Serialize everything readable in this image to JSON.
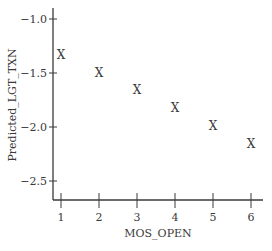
{
  "chart_data": {
    "type": "scatter",
    "title": "",
    "xlabel": "MOS_OPEN",
    "ylabel": "Predicted_LGT_TXN",
    "marker": "X",
    "x": [
      1,
      2,
      3,
      4,
      5,
      6
    ],
    "y": [
      -1.33,
      -1.5,
      -1.66,
      -1.82,
      -1.99,
      -2.16
    ],
    "xticks": [
      1,
      2,
      3,
      4,
      5,
      6
    ],
    "xtick_labels": [
      "1",
      "2",
      "3",
      "4",
      "5",
      "6"
    ],
    "yticks": [
      -1.0,
      -1.5,
      -2.0,
      -2.5
    ],
    "ytick_labels": [
      "−1.0",
      "−1.5",
      "−2.0",
      "−2.5"
    ],
    "xlim": [
      0.8,
      6.3
    ],
    "ylim": [
      -2.67,
      -0.9
    ],
    "grid": false,
    "legend": null,
    "colors": {
      "axis": "#3a3a3a",
      "text": "#3a3a3a",
      "background": "#ffffff"
    }
  }
}
